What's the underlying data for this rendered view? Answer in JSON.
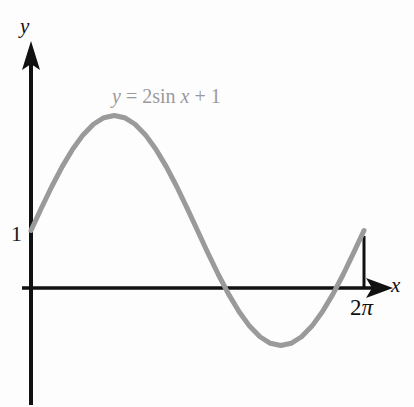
{
  "figure": {
    "background_color": "#fdfdfd",
    "width": 414,
    "height": 407
  },
  "labels": {
    "y_axis": "y",
    "x_axis": "x",
    "y_intercept_tick": "1",
    "x_end_tick_number": "2",
    "x_end_tick_symbol": "π",
    "equation_lhs": "y",
    "equation_eq": " = ",
    "equation_coeff_fn": "2sin ",
    "equation_var": "x",
    "equation_plus": " + 1"
  },
  "colors": {
    "curve": "#9a9a9a",
    "axis": "#111111",
    "equation_text": "#9a9a9a",
    "tick_text": "#1a1a1a"
  },
  "chart_data": {
    "type": "line",
    "title": "y = 2sin x + 1",
    "function": "y = 2*sin(x) + 1",
    "xlabel": "x",
    "ylabel": "y",
    "xlim": [
      0,
      6.283185307179586
    ],
    "ylim": [
      -1,
      3
    ],
    "grid": false,
    "legend": null,
    "annotations": [
      {
        "text": "y = 2sin x + 1",
        "x": 1.6,
        "y": 3.4,
        "color": "#9a9a9a"
      },
      {
        "text": "1",
        "x": 0,
        "y": 1,
        "note": "y-intercept tick label"
      },
      {
        "text": "2π",
        "x": 6.283185307179586,
        "y": 0,
        "note": "x-axis endpoint tick label"
      }
    ],
    "x_tick_labels": [
      "2π"
    ],
    "x_tick_values": [
      6.283185307179586
    ],
    "y_tick_labels": [
      "1"
    ],
    "y_tick_values": [
      1
    ],
    "key_points": {
      "start": {
        "x": 0,
        "y": 1
      },
      "maximum": {
        "x": 1.5707963267948966,
        "y": 3
      },
      "zero_crossing_1": {
        "x": 3.665191429188092,
        "y": 0
      },
      "minimum": {
        "x": 4.71238898038469,
        "y": -1
      },
      "zero_crossing_2": {
        "x": 5.759586531581288,
        "y": 0
      },
      "end": {
        "x": 6.283185307179586,
        "y": 1
      }
    },
    "x": [
      0.0,
      0.1963,
      0.3927,
      0.589,
      0.7854,
      0.9817,
      1.1781,
      1.3744,
      1.5708,
      1.7671,
      1.9635,
      2.1598,
      2.3562,
      2.5525,
      2.7489,
      2.9452,
      3.1416,
      3.3379,
      3.5343,
      3.7306,
      3.927,
      4.1233,
      4.3197,
      4.516,
      4.7124,
      4.9087,
      5.1051,
      5.3014,
      5.4978,
      5.6941,
      5.8905,
      6.0868,
      6.2832
    ],
    "y": [
      1.0,
      1.3902,
      1.7654,
      2.1111,
      2.4142,
      2.6629,
      2.8478,
      2.9616,
      3.0,
      2.9616,
      2.8478,
      2.6629,
      2.4142,
      2.1111,
      1.7654,
      1.3902,
      1.0,
      0.6098,
      0.2346,
      -0.1111,
      -0.4142,
      -0.6629,
      -0.8478,
      -0.9616,
      -1.0,
      -0.9616,
      -0.8478,
      -0.6629,
      -0.4142,
      -0.1111,
      0.2346,
      0.6098,
      1.0
    ]
  }
}
